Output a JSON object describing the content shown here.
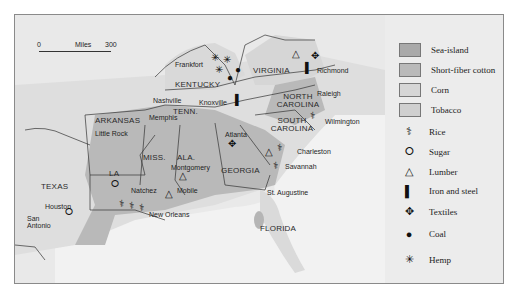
{
  "map": {
    "scale": {
      "start": "0",
      "unit": "Miles",
      "end": "300"
    },
    "states": [
      {
        "name": "KENTUCKY"
      },
      {
        "name": "VIRGINIA"
      },
      {
        "name": "NORTH CAROLINA"
      },
      {
        "name": "TENN."
      },
      {
        "name": "ARKANSAS"
      },
      {
        "name": "SOUTH CAROLINA"
      },
      {
        "name": "MISS."
      },
      {
        "name": "ALA."
      },
      {
        "name": "GEORGIA"
      },
      {
        "name": "LA"
      },
      {
        "name": "TEXAS"
      },
      {
        "name": "FLORIDA"
      }
    ],
    "cities": [
      "Frankfort",
      "Richmond",
      "Nashville",
      "Knoxville",
      "Raleigh",
      "Memphis",
      "Little Rock",
      "Wilmington",
      "Atlanta",
      "Montgomery",
      "Charleston",
      "Natchez",
      "Savannah",
      "Mobile",
      "St. Augustine",
      "Houston",
      "New Orleans",
      "San Antonio"
    ]
  },
  "legend": {
    "areas": [
      {
        "label": "Sea-island",
        "color": "#a9a9a9"
      },
      {
        "label": "Short-fiber cotton",
        "color": "#b9b9b9"
      },
      {
        "label": "Corn",
        "color": "#d6d6d6"
      },
      {
        "label": "Tobacco",
        "color": "#cfcfcf"
      }
    ],
    "symbols": [
      {
        "label": "Rice",
        "icon": "rice-icon",
        "glyph": "⚕"
      },
      {
        "label": "Sugar",
        "icon": "sugar-icon",
        "glyph": "⭘"
      },
      {
        "label": "Lumber",
        "icon": "lumber-icon",
        "glyph": "△"
      },
      {
        "label": "Iron and steel",
        "icon": "iron-steel-icon",
        "glyph": "▌"
      },
      {
        "label": "Textiles",
        "icon": "textiles-icon",
        "glyph": "✥"
      },
      {
        "label": "Coal",
        "icon": "coal-icon",
        "glyph": "●"
      },
      {
        "label": "Hemp",
        "icon": "hemp-icon",
        "glyph": "✳"
      }
    ]
  }
}
